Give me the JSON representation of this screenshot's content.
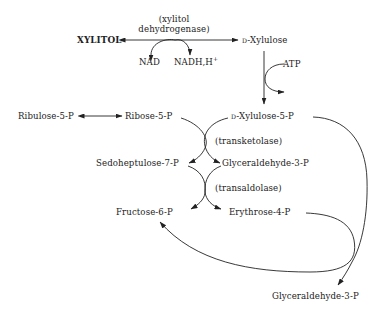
{
  "diagram": {
    "nodes": {
      "xylitol": "XYLITOL",
      "d_prefix": "D",
      "d_xylulose": "-Xylulose",
      "nad": "NAD",
      "nadh": "NADH,H",
      "nadh_sup": "+",
      "atp": "ATP",
      "d_xylulose_5p": "-Xylulose-5-P",
      "ribulose_5p": "Ribulose-5-P",
      "ribose_5p": "Ribose-5-P",
      "sedoheptulose_7p": "Sedoheptulose-7-P",
      "glyceraldehyde_3p_mid": "Glyceraldehyde-3-P",
      "fructose_6p": "Fructose-6-P",
      "erythrose_4p": "Erythrose-4-P",
      "glyceraldehyde_3p_bottom": "Glyceraldehyde-3-P"
    },
    "enzymes": {
      "xylitol_dehydrogenase_line1": "(xylitol",
      "xylitol_dehydrogenase_line2": "dehydrogenase)",
      "transketolase": "(transketolase)",
      "transaldolase": "(transaldolase)"
    },
    "colors": {
      "ink": "#222222",
      "background": "#ffffff"
    }
  }
}
